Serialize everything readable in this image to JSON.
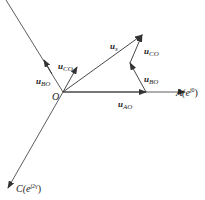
{
  "diagram": {
    "origin_label": "O",
    "axes": {
      "A": {
        "name": "A",
        "phase": "j0",
        "label_prefix": "A(e",
        "label_suffix": ")"
      },
      "C": {
        "name": "C",
        "phase": "j2γ",
        "label_prefix": "C(e",
        "label_suffix": ")"
      }
    },
    "vectors": {
      "u_s": {
        "main": "u",
        "sub": "s"
      },
      "u_AO": {
        "main": "u",
        "sub": "AO"
      },
      "u_BO_axis": {
        "main": "u",
        "sub": "BO"
      },
      "u_CO_axis": {
        "main": "u",
        "sub": "CO"
      },
      "u_BO_chain": {
        "main": "u",
        "sub": "BO"
      },
      "u_CO_chain": {
        "main": "u",
        "sub": "CO"
      }
    },
    "colors": {
      "line": "#333333",
      "background": "#ffffff"
    }
  }
}
